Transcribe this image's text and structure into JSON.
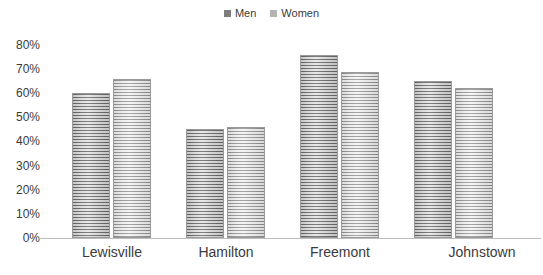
{
  "chart_data": {
    "type": "bar",
    "title": "",
    "subtitle": "",
    "xlabel": "",
    "ylabel": "",
    "categories": [
      "Lewisville",
      "Hamilton",
      "Freemont",
      "Johnstown"
    ],
    "series": [
      {
        "name": "Men",
        "values": [
          60,
          45,
          76,
          65
        ],
        "color": "#7d7d7d"
      },
      {
        "name": "Women",
        "values": [
          66,
          46,
          69,
          62
        ],
        "color": "#b4b4b4"
      }
    ],
    "ylim": [
      0,
      80
    ],
    "ytick_step": 10,
    "ytick_labels": [
      "0%",
      "10%",
      "20%",
      "30%",
      "40%",
      "50%",
      "60%",
      "70%",
      "80%"
    ],
    "ytick_values": [
      0,
      10,
      20,
      30,
      40,
      50,
      60,
      70,
      80
    ],
    "grid": false,
    "legend_position": "top-center",
    "value_suffix": "%",
    "bar_style": "ridged-cylinder"
  },
  "legend": {
    "entries": [
      {
        "label": "Men",
        "color": "#7d7d7d"
      },
      {
        "label": "Women",
        "color": "#b4b4b4"
      }
    ]
  },
  "colors": {
    "men": "#7d7d7d",
    "women": "#b4b4b4",
    "axis": "#bdbdbd",
    "text": "#3b3b3b",
    "background": "#ffffff"
  }
}
